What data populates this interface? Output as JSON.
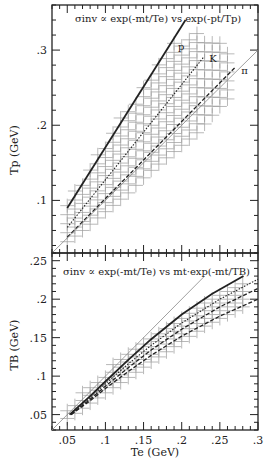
{
  "colors": {
    "background": "#ffffff",
    "ink": "#222222",
    "grid_cross": "#9a9a9a",
    "diagonal": "#888888"
  },
  "chart_data": [
    {
      "type": "line",
      "panel": "upper",
      "title": "σinv ∝ exp(-mt/Te) vs exp(-pt/Tp)",
      "xlabel": "",
      "ylabel": "Tp (GeV)",
      "xlim": [
        0.03,
        0.3
      ],
      "ylim": [
        0.03,
        0.36
      ],
      "yticks": [
        0.1,
        0.2,
        0.3
      ],
      "ytick_labels": [
        ".1",
        ".2",
        ".3"
      ],
      "y_minor_step": 0.02,
      "x_minor_step": 0.01,
      "grid": false,
      "legend": "inline labels",
      "series": [
        {
          "name": "p",
          "label": "p",
          "style": "solid-thick",
          "x": [
            0.05,
            0.205
          ],
          "y": [
            0.09,
            0.34
          ],
          "label_pos": [
            0.195,
            0.3
          ]
        },
        {
          "name": "K",
          "label": "K",
          "style": "dotted",
          "x": [
            0.05,
            0.229
          ],
          "y": [
            0.064,
            0.291
          ],
          "label_pos": [
            0.236,
            0.284
          ]
        },
        {
          "name": "pi",
          "label": "π",
          "style": "dashed",
          "x": [
            0.05,
            0.271
          ],
          "y": [
            0.051,
            0.278
          ],
          "label_pos": [
            0.278,
            0.268
          ]
        },
        {
          "name": "diagonal",
          "label": "",
          "style": "thin",
          "x": [
            0.03,
            0.3
          ],
          "y": [
            0.03,
            0.3
          ]
        }
      ],
      "error_cross_band": {
        "x_lo": [
          0.05,
          0.07,
          0.1,
          0.13,
          0.16,
          0.19,
          0.22,
          0.25,
          0.27
        ],
        "y_lo": [
          0.045,
          0.06,
          0.085,
          0.11,
          0.14,
          0.165,
          0.19,
          0.225,
          0.245
        ],
        "y_hi": [
          0.1,
          0.13,
          0.18,
          0.225,
          0.27,
          0.31,
          0.325,
          0.31,
          0.29
        ]
      }
    },
    {
      "type": "line",
      "panel": "lower",
      "title": "σinv ∝ exp(-mt/Te) vs mt·exp(-mt/TB)",
      "xlabel": "Te (GeV)",
      "ylabel": "TB (GeV)",
      "xlim": [
        0.03,
        0.3
      ],
      "ylim": [
        0.03,
        0.26
      ],
      "xticks": [
        0.05,
        0.1,
        0.15,
        0.2,
        0.25,
        0.3
      ],
      "xtick_labels": [
        ".05",
        ".1",
        ".15",
        ".2",
        ".25",
        ".3"
      ],
      "yticks": [
        0.05,
        0.1,
        0.15,
        0.2,
        0.25
      ],
      "ytick_labels": [
        ".05",
        ".1",
        ".15",
        ".2",
        ".25"
      ],
      "y_minor_step": 0.01,
      "x_minor_step": 0.01,
      "grid": false,
      "series": [
        {
          "name": "p",
          "style": "solid-thick",
          "x": [
            0.053,
            0.08,
            0.1,
            0.13,
            0.16,
            0.2,
            0.24,
            0.281
          ],
          "y": [
            0.05,
            0.074,
            0.093,
            0.121,
            0.148,
            0.18,
            0.207,
            0.23
          ]
        },
        {
          "name": "K",
          "style": "dotted",
          "x": [
            0.055,
            0.08,
            0.1,
            0.13,
            0.16,
            0.2,
            0.25,
            0.3
          ],
          "y": [
            0.05,
            0.072,
            0.09,
            0.116,
            0.14,
            0.169,
            0.2,
            0.226
          ]
        },
        {
          "name": "pi-1",
          "style": "dashed",
          "x": [
            0.055,
            0.08,
            0.1,
            0.13,
            0.16,
            0.2,
            0.25,
            0.3
          ],
          "y": [
            0.05,
            0.07,
            0.087,
            0.111,
            0.134,
            0.161,
            0.19,
            0.214
          ]
        },
        {
          "name": "pi-2",
          "style": "dashed",
          "x": [
            0.055,
            0.08,
            0.1,
            0.13,
            0.16,
            0.2,
            0.25,
            0.3
          ],
          "y": [
            0.05,
            0.068,
            0.084,
            0.106,
            0.127,
            0.152,
            0.178,
            0.2
          ]
        },
        {
          "name": "diagonal",
          "style": "thin",
          "x": [
            0.03,
            0.23
          ],
          "y": [
            0.03,
            0.23
          ]
        }
      ],
      "error_cross_band": {
        "x_lo": [
          0.05,
          0.08,
          0.11,
          0.14,
          0.17,
          0.2,
          0.23,
          0.26,
          0.29
        ],
        "y_lo": [
          0.045,
          0.065,
          0.085,
          0.105,
          0.125,
          0.145,
          0.165,
          0.18,
          0.195
        ],
        "y_hi": [
          0.06,
          0.09,
          0.115,
          0.14,
          0.165,
          0.185,
          0.205,
          0.22,
          0.225
        ]
      }
    }
  ]
}
